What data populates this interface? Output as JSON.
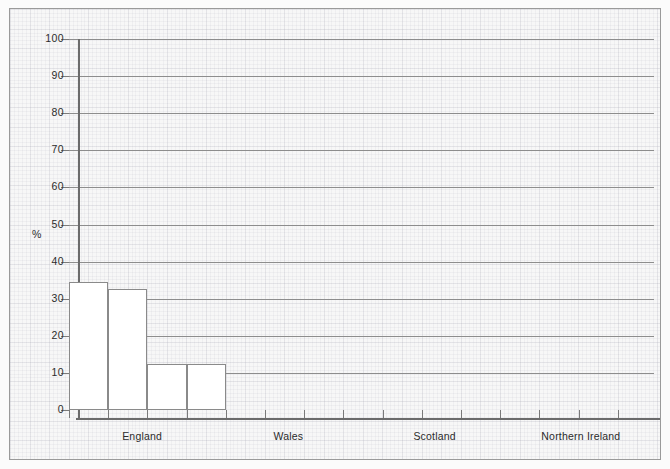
{
  "chart_data": {
    "type": "bar",
    "title": "",
    "subtitle": "",
    "xlabel": "",
    "ylabel": "%",
    "ylim": [
      0,
      100
    ],
    "ytick_values": [
      0,
      10,
      20,
      30,
      40,
      50,
      60,
      70,
      80,
      90,
      100
    ],
    "ytick_labels": [
      "0",
      "10",
      "20",
      "30",
      "40",
      "50",
      "60",
      "70",
      "80",
      "90",
      "100"
    ],
    "grid": "horizontal",
    "legend": "none",
    "categories": [
      "England",
      "Wales",
      "Scotland",
      "Northern Ireland"
    ],
    "bars": [
      {
        "label": "",
        "value": 34.5,
        "group": "England"
      },
      {
        "label": "",
        "value": 32.5,
        "group": "England"
      },
      {
        "label": "",
        "value": 12.5,
        "group": "England"
      },
      {
        "label": "",
        "value": 12.5,
        "group": "England"
      }
    ],
    "values": [
      34.5,
      32.5,
      12.5,
      12.5
    ],
    "annotations": [],
    "bar_fill": "#ffffff",
    "bar_stroke": "#8a8a8a",
    "axis_color": "#6b6b6b",
    "grid_color": "#8d8d8d",
    "background": "#f7f7f7"
  }
}
